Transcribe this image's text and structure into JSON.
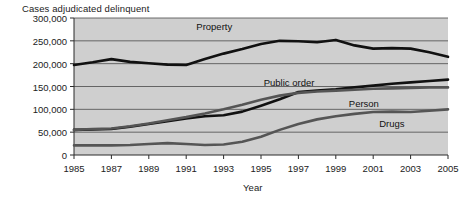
{
  "chart_data": {
    "type": "line",
    "title": "Cases adjudicated delinquent",
    "xlabel": "Year",
    "ylabel": "",
    "xlim": [
      1985,
      2005
    ],
    "ylim": [
      0,
      300000
    ],
    "grid": true,
    "legend_position": "inline-labels",
    "plot_background": "#cfcfcf",
    "xticks": [
      1985,
      1987,
      1989,
      1991,
      1993,
      1995,
      1997,
      1999,
      2001,
      2003,
      2005
    ],
    "xtick_labels": [
      "1985",
      "1987",
      "1989",
      "1991",
      "1993",
      "1995",
      "1997",
      "1999",
      "2001",
      "2003",
      "2005"
    ],
    "yticks": [
      0,
      50000,
      100000,
      150000,
      200000,
      250000,
      300000
    ],
    "ytick_labels": [
      "0",
      "50,000",
      "100,000",
      "150,000",
      "200,000",
      "250,000",
      "300,000"
    ],
    "x": [
      1985,
      1986,
      1987,
      1988,
      1989,
      1990,
      1991,
      1992,
      1993,
      1994,
      1995,
      1996,
      1997,
      1998,
      1999,
      2000,
      2001,
      2002,
      2003,
      2004,
      2005
    ],
    "series": [
      {
        "name": "Property",
        "color": "#111111",
        "width": 2.6,
        "label_x": 1992.5,
        "label_y": 283000,
        "values": [
          197000,
          203000,
          210000,
          204000,
          201000,
          198000,
          197000,
          210000,
          222000,
          232000,
          243000,
          250000,
          249000,
          247000,
          252000,
          240000,
          233000,
          234000,
          233000,
          225000,
          215000
        ]
      },
      {
        "name": "Public order",
        "color": "#111111",
        "width": 2.6,
        "label_x": 1996.5,
        "label_y": 160000,
        "values": [
          55000,
          56000,
          57000,
          62000,
          68000,
          74000,
          80000,
          85000,
          87000,
          95000,
          108000,
          122000,
          138000,
          141000,
          144000,
          148000,
          152000,
          156000,
          159000,
          162000,
          165000
        ]
      },
      {
        "name": "Person",
        "color": "#555555",
        "width": 2.6,
        "label_x": 2000.5,
        "label_y": 114000,
        "values": [
          55000,
          57000,
          58000,
          63000,
          69000,
          76000,
          83000,
          91000,
          100000,
          110000,
          121000,
          130000,
          136000,
          139000,
          141000,
          143000,
          145000,
          146000,
          147000,
          148000,
          148000
        ]
      },
      {
        "name": "Drugs",
        "color": "#555555",
        "width": 2.6,
        "label_x": 2002.0,
        "label_y": 70000,
        "values": [
          21000,
          21000,
          21000,
          22000,
          24000,
          26000,
          24000,
          22000,
          23000,
          29000,
          40000,
          55000,
          68000,
          78000,
          85000,
          90000,
          94000,
          95000,
          94000,
          97000,
          100000
        ]
      }
    ]
  }
}
